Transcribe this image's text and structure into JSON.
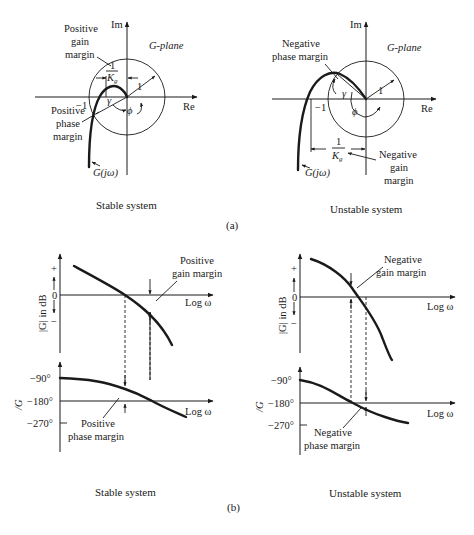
{
  "figure": {
    "part_a_label": "(a)",
    "part_b_label": "(b)",
    "stable_caption": "Stable system",
    "unstable_caption": "Unstable system"
  },
  "nyquist_stable": {
    "axis_im": "Im",
    "axis_re": "Re",
    "plane_label": "G-plane",
    "minus_one": "−1",
    "radius_label": "1",
    "gamma": "γ",
    "phi": "ϕ",
    "kg_num": "1",
    "kg_den": "K",
    "kg_sub": "g",
    "curve_label": "G(jω)",
    "gain_margin_label": [
      "Positive",
      "gain",
      "margin"
    ],
    "phase_margin_label": [
      "Positive",
      "phase",
      "margin"
    ]
  },
  "nyquist_unstable": {
    "axis_im": "Im",
    "axis_re": "Re",
    "plane_label": "G-plane",
    "minus_one": "−1",
    "radius_label": "1",
    "gamma": "γ",
    "phi": "ϕ",
    "kg_num": "1",
    "kg_den": "K",
    "kg_sub": "g",
    "curve_label": "G(jω)",
    "gain_margin_label": [
      "Negative",
      "gain",
      "margin"
    ],
    "phase_margin_label": [
      "Negative",
      "phase margin"
    ]
  },
  "bode_stable": {
    "mag_axis_label": "|G| in dB",
    "plus": "+",
    "minus": "−",
    "zero": "0",
    "x_label": "Log ω",
    "phase_axis_label": "/G",
    "phase_ticks": [
      "−90°",
      "−180°",
      "−270°"
    ],
    "gain_margin_label": [
      "Positive",
      "gain margin"
    ],
    "phase_margin_label": [
      "Positive",
      "phase margin"
    ]
  },
  "bode_unstable": {
    "mag_axis_label": "|G| in dB",
    "plus": "+",
    "minus": "−",
    "zero": "0",
    "x_label": "Log ω",
    "phase_axis_label": "/G",
    "phase_ticks": [
      "−90°",
      "−180°",
      "−270°"
    ],
    "gain_margin_label": [
      "Negative",
      "gain margin"
    ],
    "phase_margin_label": [
      "Negative",
      "phase margin"
    ]
  }
}
